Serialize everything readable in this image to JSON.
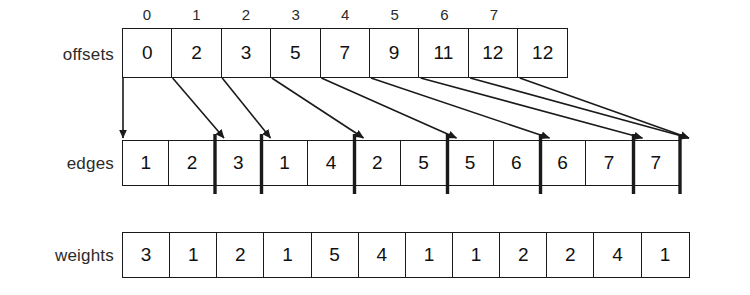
{
  "diagram": {
    "stroke_color": "#1a1a1a",
    "background_color": "#ffffff",
    "rows": {
      "offsets": {
        "label": "offsets",
        "values": [
          "0",
          "2",
          "3",
          "5",
          "7",
          "9",
          "11",
          "12",
          "12"
        ],
        "index_labels": [
          "0",
          "1",
          "2",
          "3",
          "4",
          "5",
          "6",
          "7"
        ]
      },
      "edges": {
        "label": "edges",
        "values": [
          "1",
          "2",
          "3",
          "1",
          "4",
          "2",
          "5",
          "5",
          "6",
          "6",
          "7",
          "7"
        ],
        "partition_boundaries": [
          2,
          3,
          5,
          7,
          9,
          11,
          12
        ]
      },
      "weights": {
        "label": "weights",
        "values": [
          "3",
          "1",
          "2",
          "1",
          "5",
          "4",
          "1",
          "1",
          "2",
          "2",
          "4",
          "1"
        ]
      }
    },
    "pointers": [
      {
        "from_offset_index": 0,
        "to_edge_index": 0
      },
      {
        "from_offset_index": 1,
        "to_edge_index": 2
      },
      {
        "from_offset_index": 2,
        "to_edge_index": 3
      },
      {
        "from_offset_index": 3,
        "to_edge_index": 5
      },
      {
        "from_offset_index": 4,
        "to_edge_index": 7
      },
      {
        "from_offset_index": 5,
        "to_edge_index": 9
      },
      {
        "from_offset_index": 6,
        "to_edge_index": 11
      },
      {
        "from_offset_index": 7,
        "to_edge_index": 12
      },
      {
        "from_offset_index": 8,
        "to_edge_index": 12
      }
    ]
  }
}
